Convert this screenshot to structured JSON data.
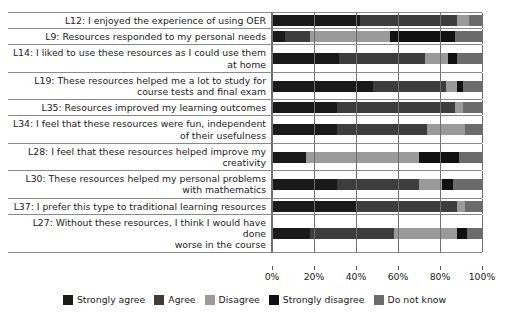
{
  "chart_data": {
    "type": "bar",
    "orientation": "horizontal",
    "stacked": true,
    "stacked_mode": "percent",
    "title": "",
    "xlabel": "",
    "ylabel": "",
    "xlim": [
      0,
      100
    ],
    "xticks": [
      0,
      20,
      40,
      60,
      80,
      100
    ],
    "xtick_labels": [
      "0%",
      "20%",
      "40%",
      "60%",
      "80%",
      "100%"
    ],
    "grid": true,
    "legend_position": "bottom",
    "series": [
      {
        "name": "Strongly agree",
        "color": "#1a1a1a",
        "values": [
          42,
          6,
          32,
          48,
          31,
          31,
          16,
          31,
          40,
          18
        ]
      },
      {
        "name": "Agree",
        "color": "#3d3d3d",
        "values": [
          46,
          12,
          41,
          35,
          56,
          43,
          0,
          39,
          48,
          40
        ]
      },
      {
        "name": "Disagree",
        "color": "#9a9a9a",
        "values": [
          6,
          38,
          11,
          5,
          4,
          18,
          54,
          11,
          4,
          30
        ]
      },
      {
        "name": "Strongly disagree",
        "color": "#111111",
        "values": [
          0,
          31,
          4,
          3,
          0,
          0,
          19,
          5,
          0,
          5
        ]
      },
      {
        "name": "Do not know",
        "color": "#6b6b6b",
        "values": [
          6,
          13,
          12,
          9,
          9,
          8,
          11,
          14,
          8,
          7
        ]
      }
    ],
    "categories": [
      "L12: I enjoyed the experience of using OER",
      "L9: Resources responded to my personal needs",
      "L14: I liked to use these resources as I could use them at home",
      "L19: These resources helped me a lot to study for course tests and final exam",
      "L35: Resources improved my learning outcomes",
      "L34: I feel that these resources were fun, independent of their usefulness",
      "L28: I feel that these resources helped improve my creativity",
      "L30: These resources helped my personal problems with mathematics",
      "L37: I prefer this type to traditional learning resources",
      "L27: Without these resources, I think I would have done worse in the course"
    ],
    "category_lines": [
      [
        "L12: I enjoyed the experience of using OER"
      ],
      [
        "L9: Resources responded to my personal needs"
      ],
      [
        "L14: I liked to use these resources as I could use them",
        "at home"
      ],
      [
        "L19: These resources helped me a lot to study for",
        "course tests and final exam"
      ],
      [
        "L35: Resources improved my learning outcomes"
      ],
      [
        "L34: I feel that these resources were fun, independent",
        "of their usefulness"
      ],
      [
        "L28: I feel that these resources helped improve my",
        "creativity"
      ],
      [
        "L30: These resources helped my personal problems",
        "with mathematics"
      ],
      [
        "L37: I prefer this type to traditional learning resources"
      ],
      [
        "L27: Without these resources, I think I would have done",
        "worse in the course"
      ]
    ]
  },
  "legend": {
    "items": [
      {
        "label": "Strongly agree",
        "color": "#1a1a1a"
      },
      {
        "label": "Agree",
        "color": "#3d3d3d"
      },
      {
        "label": "Disagree",
        "color": "#9a9a9a"
      },
      {
        "label": "Strongly disagree",
        "color": "#111111"
      },
      {
        "label": "Do not know",
        "color": "#6b6b6b"
      }
    ]
  },
  "axis": {
    "ticks": [
      {
        "value": 0,
        "label": "0%"
      },
      {
        "value": 20,
        "label": "20%"
      },
      {
        "value": 40,
        "label": "40%"
      },
      {
        "value": 60,
        "label": "60%"
      },
      {
        "value": 80,
        "label": "80%"
      },
      {
        "value": 100,
        "label": "100%"
      }
    ]
  }
}
